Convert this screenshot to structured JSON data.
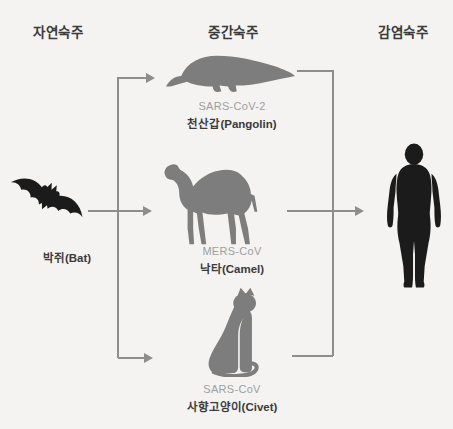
{
  "colors": {
    "background": "#f4f3f1",
    "silhouette_dark": "#1b1b1b",
    "silhouette_gray": "#7d7d7d",
    "arrow": "#8d8d8d",
    "text_dark": "#3a3a3a",
    "text_gray": "#9e9e9e"
  },
  "headers": {
    "natural": "자연숙주",
    "intermediate": "중간숙주",
    "infected": "감염숙주"
  },
  "natural_host": {
    "icon": "bat-icon",
    "label": "박쥐(Bat)"
  },
  "intermediate_hosts": [
    {
      "icon": "pangolin-icon",
      "virus": "SARS-CoV-2",
      "label": "천산갑(Pangolin)"
    },
    {
      "icon": "camel-icon",
      "virus": "MERS-CoV",
      "label": "낙타(Camel)"
    },
    {
      "icon": "civet-icon",
      "virus": "SARS-CoV",
      "label": "사향고양이(Civet)"
    }
  ],
  "infected_host": {
    "icon": "human-icon"
  }
}
